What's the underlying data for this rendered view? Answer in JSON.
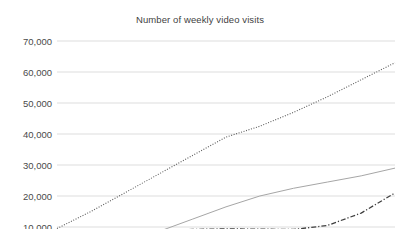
{
  "chart_data": {
    "type": "line",
    "title": "Number of weekly video visits",
    "xlabel": "",
    "ylabel": "",
    "ylim": [
      10000,
      70000
    ],
    "ytick_labels": [
      "70,000",
      "60,000",
      "50,000",
      "40,000",
      "30,000",
      "20,000",
      "10,000"
    ],
    "ytick_values": [
      70000,
      60000,
      50000,
      40000,
      30000,
      20000,
      10000
    ],
    "grid": true,
    "grid_color": "#d4d4d4",
    "legend_position": "none",
    "cropped_bottom": true,
    "x": [
      0,
      1,
      2,
      3,
      4,
      5,
      6,
      7,
      8,
      9,
      10
    ],
    "series": [
      {
        "name": "series-1",
        "style": "dotted",
        "color": "#5a5a5a",
        "values": [
          9500,
          15000,
          21000,
          27000,
          33000,
          39000,
          42500,
          47000,
          52000,
          57500,
          63000
        ]
      },
      {
        "name": "series-2",
        "style": "solid",
        "color": "#a6a6a6",
        "values": [
          null,
          null,
          null,
          8500,
          12500,
          16500,
          20000,
          22500,
          24500,
          26500,
          29000
        ]
      },
      {
        "name": "series-3",
        "style": "dash-dot",
        "color": "#404040",
        "values": [
          null,
          null,
          null,
          8800,
          9200,
          9400,
          9300,
          9200,
          10500,
          14500,
          21000
        ]
      }
    ]
  }
}
